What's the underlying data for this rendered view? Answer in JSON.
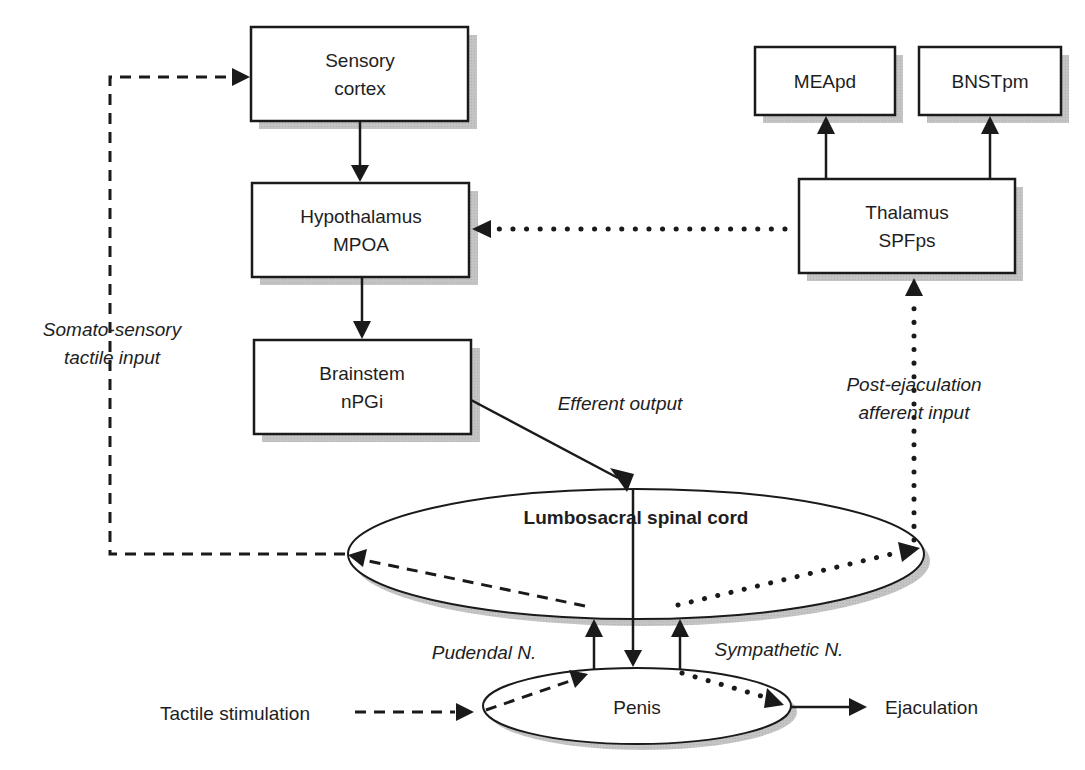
{
  "diagram": {
    "nodes": {
      "sensory_cortex": {
        "line1": "Sensory",
        "line2": "cortex"
      },
      "hypothalamus": {
        "line1": "Hypothalamus",
        "line2": "MPOA"
      },
      "brainstem": {
        "line1": "Brainstem",
        "line2": "nPGi"
      },
      "meapd": {
        "label": "MEApd"
      },
      "bnstpm": {
        "label": "BNSTpm"
      },
      "thalamus": {
        "line1": "Thalamus",
        "line2": "SPFps"
      },
      "spinal_cord": {
        "label": "Lumbosacral spinal cord"
      },
      "penis": {
        "label": "Penis"
      }
    },
    "labels": {
      "somato_line1": "Somato-sensory",
      "somato_line2": "tactile input",
      "efferent": "Efferent output",
      "post_ej_line1": "Post-ejaculation",
      "post_ej_line2": "afferent input",
      "pudendal": "Pudendal N.",
      "sympathetic": "Sympathetic N.",
      "tactile_stim": "Tactile stimulation",
      "ejaculation": "Ejaculation"
    },
    "edges": [
      {
        "from": "Sensory cortex",
        "to": "Hypothalamus MPOA",
        "style": "solid"
      },
      {
        "from": "Hypothalamus MPOA",
        "to": "Brainstem nPGi",
        "style": "solid"
      },
      {
        "from": "Brainstem nPGi",
        "to": "Lumbosacral spinal cord",
        "style": "solid",
        "label": "Efferent output"
      },
      {
        "from": "Lumbosacral spinal cord",
        "to": "Penis",
        "style": "solid"
      },
      {
        "from": "Penis",
        "to": "Lumbosacral spinal cord",
        "style": "solid",
        "label": "Pudendal N."
      },
      {
        "from": "Penis",
        "to": "Lumbosacral spinal cord",
        "style": "solid",
        "label": "Sympathetic N."
      },
      {
        "from": "Lumbosacral spinal cord",
        "to": "Sensory cortex",
        "style": "dashed",
        "label": "Somato-sensory tactile input"
      },
      {
        "from": "Lumbosacral spinal cord",
        "to": "Thalamus SPFps",
        "style": "dotted",
        "label": "Post-ejaculation afferent input"
      },
      {
        "from": "Thalamus SPFps",
        "to": "Hypothalamus MPOA",
        "style": "dotted"
      },
      {
        "from": "Thalamus SPFps",
        "to": "MEApd",
        "style": "solid"
      },
      {
        "from": "Thalamus SPFps",
        "to": "BNSTpm",
        "style": "solid"
      },
      {
        "from": "Tactile stimulation",
        "to": "Penis",
        "style": "dashed"
      },
      {
        "from": "Penis",
        "to": "Ejaculation",
        "style": "solid"
      }
    ]
  }
}
